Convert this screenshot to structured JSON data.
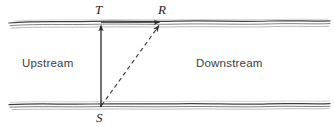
{
  "figure": {
    "type": "river-crossing-diagram",
    "width": 334,
    "height": 127,
    "background_color": "#ffffff"
  },
  "labels": {
    "upstream": "Upstream",
    "downstream": "Downstream",
    "point_t": "T",
    "point_r": "R",
    "point_s": "S"
  },
  "colors": {
    "bank_line": "#4a4a4a",
    "bank_line_light": "#8f8f8f",
    "arrow": "#262626",
    "dashed_arrow": "#555555",
    "region_text": "#3b3b3b",
    "point_text": "#1c1c1c"
  },
  "geometry": {
    "top_bank_y": 22,
    "bottom_bank_y": 106,
    "bank_left_x": 9,
    "bank_right_x": 330,
    "point_s": {
      "x": 101,
      "y": 106
    },
    "point_t": {
      "x": 101,
      "y": 22
    },
    "point_r": {
      "x": 163,
      "y": 22
    }
  }
}
